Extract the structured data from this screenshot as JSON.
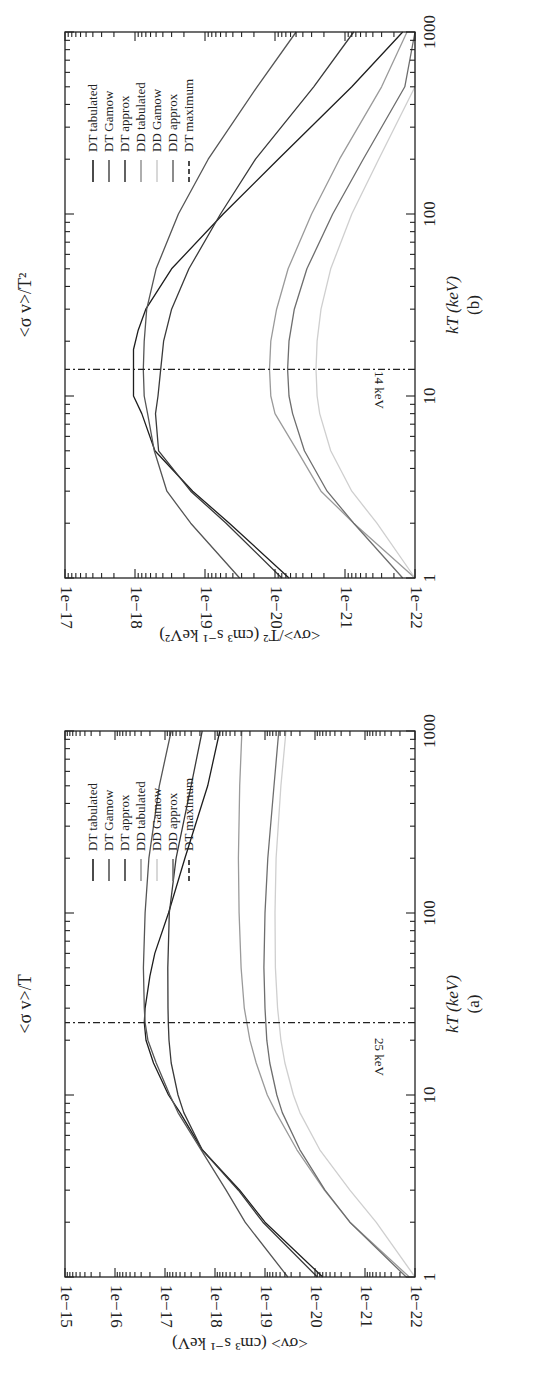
{
  "chart_data": [
    {
      "id": "b",
      "type": "line",
      "title": "<σ v>/T²",
      "panel_label": "(b)",
      "xlabel": "kT (keV)",
      "ylabel": "<σv>/T² (cm³ s⁻¹ keV²)",
      "xscale": "log",
      "yscale": "log",
      "xlim": [
        1,
        1000
      ],
      "ylim": [
        1e-22,
        1e-17
      ],
      "x_ticks": [
        "1",
        "10",
        "100",
        "1000"
      ],
      "y_ticks": [
        "1e−22",
        "1e−21",
        "1e−20",
        "1e−19",
        "1e−18",
        "1e−17"
      ],
      "grid": false,
      "legend_position": "upper right",
      "orientation": "rotated 90° counter-clockwise on page",
      "annotation": {
        "text": "14 keV",
        "x": 14
      },
      "series": [
        {
          "name": "DT tabulated",
          "color": "#1e1e1e",
          "dash": "solid",
          "x": [
            1,
            2,
            3,
            5,
            8,
            10,
            14,
            18,
            23,
            30,
            50,
            100,
            200,
            500,
            1000
          ],
          "y": [
            6.3e-21,
            4.5e-20,
            1.5e-19,
            5.2e-19,
            8e-19,
            1.05e-18,
            1.05e-18,
            1.05e-18,
            9e-19,
            7e-19,
            3e-19,
            5.5e-20,
            9e-21,
            8e-22,
            1.5e-22
          ]
        },
        {
          "name": "DT Gamow",
          "color": "#555555",
          "dash": "solid",
          "x": [
            1,
            2,
            3,
            5,
            8,
            10,
            14,
            20,
            30,
            50,
            100,
            200,
            500,
            1000
          ],
          "y": [
            3.2e-20,
            1.6e-19,
            3.5e-19,
            5.3e-19,
            6.6e-19,
            7.4e-19,
            7.6e-19,
            7.4e-19,
            6.8e-19,
            5e-19,
            2.4e-19,
            9e-20,
            1.8e-20,
            5e-21
          ]
        },
        {
          "name": "DT approx",
          "color": "#3a3a3a",
          "dash": "solid",
          "x": [
            1,
            2,
            3,
            5,
            8,
            10,
            14,
            20,
            30,
            50,
            100,
            200,
            500,
            1000
          ],
          "y": [
            8e-21,
            5e-20,
            1.6e-19,
            4.6e-19,
            5.1e-19,
            4.7e-19,
            4.3e-19,
            3.9e-19,
            3e-19,
            1.7e-19,
            6e-20,
            1.9e-20,
            2.8e-21,
            7.5e-22
          ]
        },
        {
          "name": "DD tabulated",
          "color": "#9a9a9a",
          "dash": "solid",
          "x": [
            1,
            2,
            3,
            5,
            8,
            10,
            14,
            20,
            30,
            50,
            100,
            200,
            500,
            1000
          ],
          "y": [
            1e-22,
            7.5e-22,
            2.2e-21,
            4.8e-21,
            1e-20,
            1.15e-20,
            1.2e-20,
            1.15e-20,
            9.5e-21,
            6.5e-21,
            3e-21,
            1.2e-21,
            3e-22,
            1.3e-22
          ]
        },
        {
          "name": "DD Gamow",
          "color": "#cfcfcf",
          "dash": "solid",
          "x": [
            1,
            2,
            3,
            5,
            8,
            10,
            14,
            20,
            30,
            50,
            100,
            200,
            500,
            1000
          ],
          "y": [
            1e-22,
            3.5e-22,
            8e-22,
            1.6e-21,
            2.3e-21,
            2.5e-21,
            2.6e-21,
            2.5e-21,
            2.2e-21,
            1.6e-21,
            8e-22,
            3.3e-22,
            1e-22,
            1e-22
          ]
        },
        {
          "name": "DD approx",
          "color": "#6e6e6e",
          "dash": "solid",
          "x": [
            1,
            2,
            3,
            5,
            8,
            10,
            14,
            20,
            30,
            50,
            100,
            200,
            500,
            1000
          ],
          "y": [
            1.5e-22,
            7.5e-22,
            1.8e-21,
            3.8e-21,
            5.6e-21,
            6.3e-21,
            6.6e-21,
            6.3e-21,
            5.3e-21,
            3.5e-21,
            1.5e-21,
            5.5e-22,
            1.4e-22,
            1e-22
          ]
        },
        {
          "name": "DT maximum",
          "color": "#1e1e1e",
          "dash": "dash-dot",
          "x": [
            14,
            14
          ],
          "y": [
            1e-22,
            1e-17
          ]
        }
      ]
    },
    {
      "id": "a",
      "type": "line",
      "title": "<σ v>/T",
      "panel_label": "(a)",
      "xlabel": "kT (keV)",
      "ylabel": "<σv> (cm³ s⁻¹ keV)",
      "xscale": "log",
      "yscale": "log",
      "xlim": [
        1,
        1000
      ],
      "ylim": [
        1e-22,
        1e-15
      ],
      "x_ticks": [
        "1",
        "10",
        "100",
        "1000"
      ],
      "y_ticks": [
        "1e−22",
        "1e−21",
        "1e−20",
        "1e−19",
        "1e−18",
        "1e−17",
        "1e−16",
        "1e−15"
      ],
      "grid": false,
      "legend_position": "upper right",
      "orientation": "rotated 90° counter-clockwise on page",
      "annotation": {
        "text": "25 keV",
        "x": 25
      },
      "series": [
        {
          "name": "DT tabulated",
          "color": "#1e1e1e",
          "dash": "solid",
          "x": [
            1,
            2,
            3,
            5,
            8,
            10,
            15,
            20,
            25,
            30,
            45,
            60,
            100,
            200,
            500,
            1000
          ],
          "y": [
            7e-21,
            1e-19,
            3.2e-19,
            1.8e-18,
            5e-18,
            8.5e-18,
            1.7e-17,
            2.4e-17,
            2.6e-17,
            2.5e-17,
            2e-17,
            1.6e-17,
            8.5e-18,
            4e-18,
            1.4e-18,
            8e-19
          ]
        },
        {
          "name": "DT Gamow",
          "color": "#555555",
          "dash": "solid",
          "x": [
            1,
            2,
            3,
            5,
            8,
            10,
            15,
            20,
            25,
            30,
            50,
            100,
            200,
            500,
            1000
          ],
          "y": [
            3.5e-20,
            2.5e-19,
            6e-19,
            1.9e-18,
            5.5e-18,
            8e-18,
            1.5e-17,
            2.2e-17,
            2.5e-17,
            2.6e-17,
            2.7e-17,
            2.5e-17,
            2.1e-17,
            1.3e-17,
            7.5e-18
          ]
        },
        {
          "name": "DT approx",
          "color": "#3a3a3a",
          "dash": "solid",
          "x": [
            1,
            2,
            3,
            5,
            8,
            10,
            15,
            20,
            25,
            30,
            50,
            100,
            200,
            500,
            1000
          ],
          "y": [
            9e-21,
            1.1e-19,
            3.4e-19,
            1.8e-18,
            4.2e-18,
            5.5e-18,
            7.5e-18,
            8.3e-18,
            8.6e-18,
            8.7e-18,
            8.8e-18,
            8.2e-18,
            6e-18,
            3e-18,
            1.8e-18
          ]
        },
        {
          "name": "DD tabulated",
          "color": "#9a9a9a",
          "dash": "solid",
          "x": [
            1,
            2,
            3,
            5,
            8,
            10,
            15,
            20,
            30,
            50,
            100,
            200,
            500,
            1000
          ],
          "y": [
            1.3e-22,
            2e-21,
            6.5e-21,
            2.3e-20,
            6e-20,
            9e-20,
            1.5e-19,
            2e-19,
            2.6e-19,
            3e-19,
            3.3e-19,
            3.4e-19,
            3.2e-19,
            2.9e-19
          ]
        },
        {
          "name": "DD Gamow",
          "color": "#cfcfcf",
          "dash": "solid",
          "x": [
            1,
            2,
            3,
            5,
            8,
            10,
            15,
            20,
            30,
            50,
            100,
            200,
            500,
            1000
          ],
          "y": [
            1e-22,
            6e-22,
            2e-21,
            8e-21,
            2e-20,
            2.7e-20,
            4e-20,
            4.8e-20,
            5.6e-20,
            6.2e-20,
            6.3e-20,
            6e-20,
            4.8e-20,
            3.8e-20
          ]
        },
        {
          "name": "DD approx",
          "color": "#6e6e6e",
          "dash": "solid",
          "x": [
            1,
            2,
            3,
            5,
            8,
            10,
            15,
            20,
            30,
            50,
            100,
            200,
            500,
            1000
          ],
          "y": [
            1.5e-22,
            2e-21,
            6.3e-21,
            2e-20,
            4.5e-20,
            5.8e-20,
            8e-20,
            9.2e-20,
            1e-19,
            1.05e-19,
            1e-19,
            8.8e-20,
            6.6e-20,
            5.3e-20
          ]
        },
        {
          "name": "DT maximum",
          "color": "#1e1e1e",
          "dash": "dash-dot",
          "x": [
            25,
            25
          ],
          "y": [
            1e-22,
            1e-15
          ]
        }
      ]
    }
  ],
  "legend": {
    "items": [
      {
        "label": "DT tabulated",
        "color": "#1e1e1e",
        "dashed": false
      },
      {
        "label": "DT Gamow",
        "color": "#555555",
        "dashed": false
      },
      {
        "label": "DT approx",
        "color": "#3a3a3a",
        "dashed": false
      },
      {
        "label": "DD tabulated",
        "color": "#9a9a9a",
        "dashed": false
      },
      {
        "label": "DD Gamow",
        "color": "#cfcfcf",
        "dashed": false
      },
      {
        "label": "DD approx",
        "color": "#6e6e6e",
        "dashed": false
      },
      {
        "label": "DT maximum",
        "color": "#1e1e1e",
        "dashed": true
      }
    ]
  },
  "panels": {
    "b": {
      "title": "<σ v>/T²",
      "xlabel": "kT (keV)",
      "caption": "(b)",
      "ylabel": "<σv>/T² (cm³ s⁻¹ keV²)",
      "annotation": "14 keV",
      "x_tick_labels": [
        "1",
        "10",
        "100",
        "1000"
      ],
      "y_tick_labels": [
        "1e−17",
        "1e−18",
        "1e−19",
        "1e−20",
        "1e−21",
        "1e−22"
      ]
    },
    "a": {
      "title": "<σ v>/T",
      "xlabel": "kT (keV)",
      "caption": "(a)",
      "ylabel": "<σv> (cm³ s⁻¹ keV)",
      "annotation": "25 keV",
      "x_tick_labels": [
        "1",
        "10",
        "100",
        "1000"
      ],
      "y_tick_labels": [
        "1e−15",
        "1e−16",
        "1e−17",
        "1e−18",
        "1e−19",
        "1e−20",
        "1e−21",
        "1e−22"
      ]
    }
  }
}
